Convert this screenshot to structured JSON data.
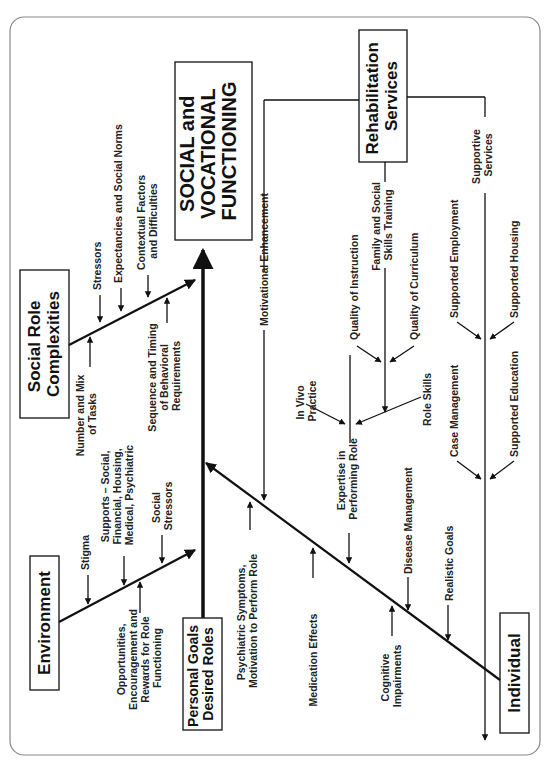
{
  "diagram": {
    "type": "fishbone",
    "orientation": "rotated-90-ccw",
    "outcome": {
      "lines": [
        "SOCIAL and",
        "VOCATIONAL",
        "FUNCTIONING"
      ]
    },
    "spine_origin": {
      "lines": [
        "Personal Goals",
        "Desired Roles"
      ]
    },
    "categories": {
      "social_role_complexities": {
        "lines": [
          "Social Role",
          "Complexities"
        ],
        "factors": {
          "stressors": [
            "Stressors"
          ],
          "expectancies": [
            "Expectancies and Social Norms"
          ],
          "contextual": [
            "Contextual Factors",
            "and Difficulties"
          ],
          "number_mix": [
            "Number and Mix",
            "of Tasks"
          ],
          "sequence_timing": [
            "Sequence and Timing",
            "of Behavioral",
            "Requirements"
          ]
        }
      },
      "environment": {
        "lines": [
          "Environment"
        ],
        "factors": {
          "stigma": [
            "Stigma"
          ],
          "supports": [
            "Supports – Social,",
            "Financial, Housing,",
            "Medical, Psychiatric"
          ],
          "social_stressors": [
            "Social",
            "Stressors"
          ],
          "opportunities": [
            "Opportunities,",
            "Encouragement and",
            "Rewards for Role",
            "Functioning"
          ]
        }
      },
      "individual": {
        "lines": [
          "Individual"
        ],
        "factors": {
          "psychiatric": [
            "Psychiatric Symptoms,",
            "Motivation to Perform Role"
          ],
          "motivational": [
            "Motivational Enhancement"
          ],
          "medication": [
            "Medication Effects"
          ],
          "expertise": [
            "Expertise in",
            "Performing Role"
          ],
          "cognitive": [
            "Cognitive",
            "Impairments"
          ],
          "disease": [
            "Disease Management"
          ],
          "realistic": [
            "Realistic Goals"
          ]
        }
      },
      "rehabilitation_services": {
        "lines": [
          "Rehabilitation",
          "Services"
        ],
        "factors": {
          "in_vivo": [
            "In Vivo",
            "Practice"
          ],
          "role_skills": [
            "Role Skills"
          ],
          "quality_instruction": [
            "Quality of Instruction"
          ],
          "family_social": [
            "Family and Social",
            "Skills Training"
          ],
          "quality_curriculum": [
            "Quality of Curriculum"
          ],
          "supportive_services": [
            "Supportive",
            "Services"
          ],
          "supported_employment": [
            "Supported Employment"
          ],
          "supported_housing": [
            "Supported Housing"
          ],
          "case_management": [
            "Case Management"
          ],
          "supported_education": [
            "Supported Education"
          ]
        }
      }
    }
  }
}
